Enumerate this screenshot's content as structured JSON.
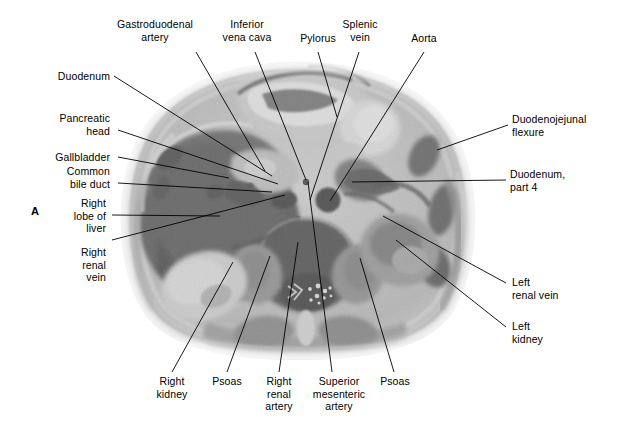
{
  "figure": {
    "letter": "A",
    "kind": "axial-abdominal-cross-section-photograph"
  },
  "labels": {
    "gastroduodenal_artery": "Gastroduodenal\nartery",
    "inferior_vena_cava": "Inferior\nvena cava",
    "pylorus": "Pylorus",
    "splenic_vein": "Splenic\nvein",
    "aorta": "Aorta",
    "duodenum": "Duodenum",
    "pancreatic_head": "Pancreatic\nhead",
    "gallbladder": "Gallbladder",
    "common_bile_duct": "Common\nbile duct",
    "right_lobe_of_liver": "Right\nlobe of\nliver",
    "right_renal_vein": "Right\nrenal\nvein",
    "duodenojejunal_flexure": "Duodenojejunal\nflexure",
    "duodenum_part_4": "Duodenum,\npart 4",
    "left_renal_vein": "Left\nrenal vein",
    "left_kidney": "Left\nkidney",
    "right_kidney": "Right\nkidney",
    "psoas_right": "Psoas",
    "right_renal_artery": "Right\nrenal\nartery",
    "superior_mesenteric_artery": "Superior\nmesenteric\nartery",
    "psoas_left": "Psoas"
  },
  "colors": {
    "text": "#000000",
    "leader": "#000000",
    "background": "#ffffff"
  }
}
